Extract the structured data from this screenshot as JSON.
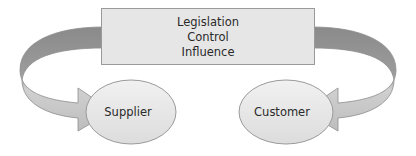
{
  "box": {
    "lines": [
      "Legislation",
      "Control",
      "Influence"
    ],
    "fill": "#e6e6e6",
    "stroke": "#9a9a9a"
  },
  "nodes": [
    {
      "id": "supplier",
      "label": "Supplier"
    },
    {
      "id": "customer",
      "label": "Customer"
    }
  ],
  "arrows": [
    {
      "from": "box",
      "to": "supplier"
    },
    {
      "from": "box",
      "to": "customer"
    }
  ]
}
